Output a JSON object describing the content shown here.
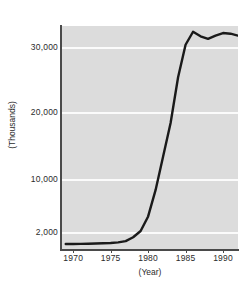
{
  "chart_data": {
    "type": "line",
    "title": "",
    "subtitle": "",
    "xlabel": "(Year)",
    "ylabel": "(Thousands)",
    "xlim": [
      1968.5,
      1992.0
    ],
    "ylim": [
      0,
      34000
    ],
    "grid": true,
    "legend": false,
    "legend_position": "none",
    "line_color": "#1a1a1a",
    "plot_background": "#dcdcdc",
    "gridline_color": "#fbfbfb",
    "axis_color": "#4a4a4a",
    "x_ticks": [
      {
        "value": 1970,
        "label": "1970"
      },
      {
        "value": 1975,
        "label": "1975"
      },
      {
        "value": 1980,
        "label": "1980"
      },
      {
        "value": 1985,
        "label": "1985"
      },
      {
        "value": 1990,
        "label": "1990"
      }
    ],
    "y_ticks": [
      {
        "value": 2000,
        "label": "2,000"
      },
      {
        "value": 10000,
        "label": "10,000"
      },
      {
        "value": 20000,
        "label": "20,000"
      },
      {
        "value": 30000,
        "label": "30,000"
      }
    ],
    "x": [
      1969,
      1970,
      1971,
      1972,
      1973,
      1974,
      1975,
      1976,
      1977,
      1978,
      1979,
      1980,
      1981,
      1982,
      1983,
      1984,
      1985,
      1986,
      1987,
      1988,
      1989,
      1990,
      1991,
      1992
    ],
    "values": [
      700,
      700,
      720,
      740,
      760,
      790,
      820,
      900,
      1050,
      1500,
      2300,
      4500,
      8500,
      13500,
      18500,
      25500,
      30500,
      32500,
      31800,
      31400,
      31900,
      32300,
      32200,
      31900
    ],
    "series": [
      {
        "name": "series-1",
        "values": [
          700,
          700,
          720,
          740,
          760,
          790,
          820,
          900,
          1050,
          1500,
          2300,
          4500,
          8500,
          13500,
          18500,
          25500,
          30500,
          32500,
          31800,
          31400,
          31900,
          32300,
          32200,
          31900
        ]
      }
    ],
    "annotations": []
  }
}
